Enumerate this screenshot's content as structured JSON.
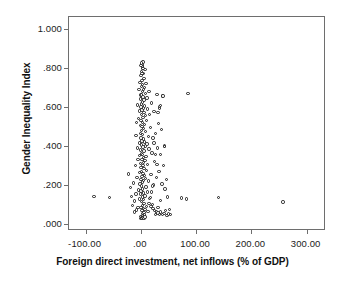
{
  "chart_data": {
    "type": "scatter",
    "title": "",
    "xlabel": "Foreign direct investment, net inflows (% of GDP)",
    "ylabel": "Gender Inequality Index",
    "xlim": [
      -130,
      335
    ],
    "ylim": [
      -0.035,
      1.06
    ],
    "xticks": [
      -100,
      0,
      100,
      200,
      300
    ],
    "xticklabels": [
      "-100.00",
      ".00",
      "100.00",
      "200.00",
      "300.00"
    ],
    "yticks": [
      0.0,
      0.2,
      0.4,
      0.6,
      0.8,
      1.0
    ],
    "yticklabels": [
      ".000",
      ".200",
      ".400",
      ".600",
      ".800",
      "1.000"
    ],
    "grid": false,
    "legend": null,
    "marker": "open-circle",
    "marker_color": "#1a1a1a",
    "marker_fill": "#ffffff",
    "frame_color": "#6e6e6e",
    "background": "#ffffff",
    "points": [
      [
        -85.0,
        0.142
      ],
      [
        -57.0,
        0.138
      ],
      [
        -22.0,
        0.256
      ],
      [
        -19.0,
        0.188
      ],
      [
        -16.5,
        0.143
      ],
      [
        -15.0,
        0.096
      ],
      [
        -13.0,
        0.21
      ],
      [
        -12.0,
        0.062
      ],
      [
        -11.0,
        0.118
      ],
      [
        -10.0,
        0.3
      ],
      [
        -9.0,
        0.455
      ],
      [
        -8.5,
        0.155
      ],
      [
        -8.0,
        0.072
      ],
      [
        -7.5,
        0.52
      ],
      [
        -7.0,
        0.24
      ],
      [
        -6.5,
        0.39
      ],
      [
        -6.0,
        0.61
      ],
      [
        -5.5,
        0.085
      ],
      [
        -5.0,
        0.33
      ],
      [
        -4.5,
        0.175
      ],
      [
        -4.0,
        0.54
      ],
      [
        -3.5,
        0.69
      ],
      [
        -3.0,
        0.415
      ],
      [
        -2.8,
        0.128
      ],
      [
        -2.5,
        0.265
      ],
      [
        -2.2,
        0.58
      ],
      [
        -2.0,
        0.35
      ],
      [
        -1.8,
        0.725
      ],
      [
        -1.5,
        0.205
      ],
      [
        -1.2,
        0.465
      ],
      [
        -1.0,
        0.64
      ],
      [
        -0.8,
        0.31
      ],
      [
        -0.6,
        0.155
      ],
      [
        -0.4,
        0.505
      ],
      [
        -0.2,
        0.38
      ],
      [
        0.0,
        0.6
      ],
      [
        0.0,
        0.23
      ],
      [
        0.0,
        0.76
      ],
      [
        0.1,
        0.44
      ],
      [
        0.2,
        0.085
      ],
      [
        0.3,
        0.66
      ],
      [
        0.4,
        0.29
      ],
      [
        0.5,
        0.53
      ],
      [
        0.6,
        0.17
      ],
      [
        0.7,
        0.705
      ],
      [
        0.8,
        0.36
      ],
      [
        0.9,
        0.615
      ],
      [
        1.0,
        0.115
      ],
      [
        1.1,
        0.48
      ],
      [
        1.2,
        0.27
      ],
      [
        1.3,
        0.78
      ],
      [
        1.4,
        0.405
      ],
      [
        1.5,
        0.56
      ],
      [
        1.6,
        0.195
      ],
      [
        1.7,
        0.66
      ],
      [
        1.8,
        0.33
      ],
      [
        1.9,
        0.07
      ],
      [
        2.0,
        0.5
      ],
      [
        2.1,
        0.245
      ],
      [
        2.2,
        0.735
      ],
      [
        2.3,
        0.425
      ],
      [
        2.4,
        0.585
      ],
      [
        2.5,
        0.14
      ],
      [
        2.6,
        0.68
      ],
      [
        2.7,
        0.355
      ],
      [
        2.8,
        0.095
      ],
      [
        2.9,
        0.52
      ],
      [
        3.0,
        0.215
      ],
      [
        3.1,
        0.8
      ],
      [
        3.2,
        0.46
      ],
      [
        3.3,
        0.625
      ],
      [
        3.4,
        0.18
      ],
      [
        3.5,
        0.715
      ],
      [
        3.6,
        0.3
      ],
      [
        3.7,
        0.055
      ],
      [
        3.8,
        0.545
      ],
      [
        3.9,
        0.26
      ],
      [
        4.0,
        0.83
      ],
      [
        4.1,
        0.395
      ],
      [
        4.2,
        0.65
      ],
      [
        4.3,
        0.125
      ],
      [
        4.4,
        0.77
      ],
      [
        4.5,
        0.34
      ],
      [
        4.6,
        0.08
      ],
      [
        4.7,
        0.49
      ],
      [
        4.8,
        0.225
      ],
      [
        4.9,
        0.595
      ],
      [
        5.0,
        0.435
      ],
      [
        5.1,
        0.16
      ],
      [
        5.2,
        0.69
      ],
      [
        5.3,
        0.315
      ],
      [
        5.4,
        0.06
      ],
      [
        5.5,
        0.57
      ],
      [
        5.6,
        0.285
      ],
      [
        5.7,
        0.745
      ],
      [
        5.8,
        0.375
      ],
      [
        5.9,
        0.635
      ],
      [
        6.0,
        0.105
      ],
      [
        6.2,
        0.51
      ],
      [
        6.4,
        0.25
      ],
      [
        6.6,
        0.7
      ],
      [
        6.8,
        0.42
      ],
      [
        7.0,
        0.605
      ],
      [
        7.2,
        0.145
      ],
      [
        7.4,
        0.79
      ],
      [
        7.6,
        0.325
      ],
      [
        7.8,
        0.075
      ],
      [
        8.0,
        0.475
      ],
      [
        8.2,
        0.235
      ],
      [
        8.4,
        0.67
      ],
      [
        8.6,
        0.4
      ],
      [
        8.8,
        0.555
      ],
      [
        9.0,
        0.19
      ],
      [
        9.2,
        0.72
      ],
      [
        9.5,
        0.345
      ],
      [
        9.8,
        0.09
      ],
      [
        10.0,
        0.53
      ],
      [
        10.4,
        0.275
      ],
      [
        10.8,
        0.645
      ],
      [
        11.2,
        0.41
      ],
      [
        11.6,
        0.165
      ],
      [
        12.0,
        0.59
      ],
      [
        12.5,
        0.305
      ],
      [
        13.0,
        0.065
      ],
      [
        13.5,
        0.45
      ],
      [
        14.0,
        0.22
      ],
      [
        14.5,
        0.68
      ],
      [
        15.0,
        0.385
      ],
      [
        15.5,
        0.56
      ],
      [
        16.0,
        0.13
      ],
      [
        17.0,
        0.495
      ],
      [
        18.0,
        0.255
      ],
      [
        19.0,
        0.62
      ],
      [
        20.0,
        0.365
      ],
      [
        21.0,
        0.1
      ],
      [
        22.0,
        0.44
      ],
      [
        23.0,
        0.2
      ],
      [
        24.0,
        0.575
      ],
      [
        25.0,
        0.32
      ],
      [
        26.0,
        0.05
      ],
      [
        27.0,
        0.465
      ],
      [
        28.0,
        0.24
      ],
      [
        29.0,
        0.665
      ],
      [
        30.0,
        0.39
      ],
      [
        31.0,
        0.085
      ],
      [
        32.0,
        0.515
      ],
      [
        33.0,
        0.27
      ],
      [
        34.0,
        0.6
      ],
      [
        35.0,
        0.355
      ],
      [
        36.0,
        0.12
      ],
      [
        37.0,
        0.485
      ],
      [
        38.0,
        0.205
      ],
      [
        39.0,
        0.655
      ],
      [
        40.0,
        0.655
      ],
      [
        41.0,
        0.3
      ],
      [
        42.0,
        0.055
      ],
      [
        43.0,
        0.4
      ],
      [
        44.0,
        0.18
      ],
      [
        45.0,
        0.07
      ],
      [
        46.0,
        0.23
      ],
      [
        47.0,
        0.045
      ],
      [
        48.0,
        0.14
      ],
      [
        50.0,
        0.052
      ],
      [
        52.0,
        0.075
      ],
      [
        54.0,
        0.048
      ],
      [
        29.0,
        0.305
      ],
      [
        26.0,
        0.355
      ],
      [
        24.0,
        0.415
      ],
      [
        21.0,
        0.195
      ],
      [
        19.0,
        0.165
      ],
      [
        17.0,
        0.135
      ],
      [
        15.0,
        0.105
      ],
      [
        18.0,
        0.09
      ],
      [
        22.0,
        0.08
      ],
      [
        25.0,
        0.07
      ],
      [
        28.0,
        0.062
      ],
      [
        31.0,
        0.058
      ],
      [
        34.0,
        0.05
      ],
      [
        36.0,
        0.062
      ],
      [
        39.0,
        0.048
      ],
      [
        43.0,
        0.398
      ],
      [
        34.0,
        0.592
      ],
      [
        36.0,
        0.608
      ],
      [
        31.0,
        0.57
      ],
      [
        85.0,
        0.668
      ],
      [
        74.0,
        0.133
      ],
      [
        83.0,
        0.128
      ],
      [
        141.0,
        0.135
      ],
      [
        257.0,
        0.113
      ],
      [
        -0.3,
        0.038
      ],
      [
        0.5,
        0.03
      ],
      [
        1.4,
        0.035
      ],
      [
        2.3,
        0.028
      ],
      [
        3.1,
        0.042
      ],
      [
        4.0,
        0.033
      ],
      [
        4.9,
        0.04
      ],
      [
        5.8,
        0.03
      ],
      [
        6.5,
        0.046
      ],
      [
        7.3,
        0.036
      ],
      [
        2.0,
        0.815
      ],
      [
        1.3,
        0.825
      ],
      [
        2.9,
        0.808
      ],
      [
        3.6,
        0.795
      ],
      [
        0.6,
        0.812
      ],
      [
        1.9,
        0.772
      ]
    ]
  }
}
